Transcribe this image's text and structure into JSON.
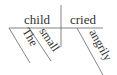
{
  "diagram": {
    "type": "sentence-diagram",
    "subject": "child",
    "verb": "cried",
    "subject_modifiers": [
      "The",
      "small"
    ],
    "verb_modifiers": [
      "angrily"
    ],
    "line_color": "#555555",
    "text_color": "#333333"
  }
}
